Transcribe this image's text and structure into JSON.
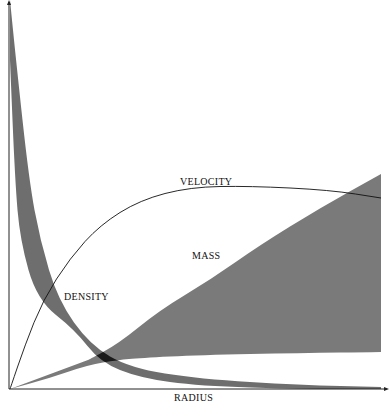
{
  "chart_data": {
    "type": "area",
    "title": "",
    "xlabel": "RADIUS",
    "ylabel": "",
    "grid": false,
    "legend": "none (inline labels)",
    "axis_ranges": {
      "x": [
        0,
        1
      ],
      "y": [
        0,
        1
      ]
    },
    "annotations": [
      "VELOCITY",
      "MASS",
      "DENSITY"
    ],
    "series": [
      {
        "name": "DENSITY",
        "style": "shaded band (dark gray)",
        "color": "#6e6e6e",
        "upper_edge": [
          [
            10,
            0
          ],
          [
            16,
            60
          ],
          [
            29,
            180
          ],
          [
            40,
            240
          ],
          [
            58,
            300
          ],
          [
            90,
            345
          ],
          [
            130,
            368
          ],
          [
            200,
            379
          ],
          [
            300,
            385
          ],
          [
            381,
            387
          ]
        ],
        "lower_edge": [
          [
            381,
            389
          ],
          [
            300,
            389
          ],
          [
            200,
            386
          ],
          [
            140,
            378
          ],
          [
            100,
            362
          ],
          [
            75,
            330
          ],
          [
            37,
            300
          ],
          [
            20,
            240
          ],
          [
            15,
            180
          ],
          [
            10,
            60
          ]
        ]
      },
      {
        "name": "MASS",
        "style": "shaded wedge (gray)",
        "color": "#7a7a7a",
        "upper_edge": [
          [
            88,
            360
          ],
          [
            118,
            344
          ],
          [
            160,
            310
          ],
          [
            210,
            280
          ],
          [
            260,
            245
          ],
          [
            320,
            208
          ],
          [
            381,
            174
          ]
        ],
        "lower_edge": [
          [
            381,
            352
          ],
          [
            300,
            353
          ],
          [
            200,
            355
          ],
          [
            140,
            358
          ],
          [
            118,
            360
          ],
          [
            88,
            365
          ],
          [
            50,
            378
          ],
          [
            10,
            389
          ]
        ]
      },
      {
        "name": "VELOCITY",
        "style": "thin black line",
        "color": "#111111",
        "points": [
          [
            10,
            389
          ],
          [
            25,
            345
          ],
          [
            43,
            300
          ],
          [
            70,
            258
          ],
          [
            100,
            225
          ],
          [
            140,
            200
          ],
          [
            190,
            187
          ],
          [
            250,
            186
          ],
          [
            330,
            190
          ],
          [
            381,
            198
          ]
        ]
      }
    ],
    "overlap_region": {
      "description": "dark intersection of density and mass bands",
      "color": "#1a1a1a"
    }
  },
  "labels": {
    "velocity": "VELOCITY",
    "mass": "MASS",
    "density": "DENSITY",
    "radius": "RADIUS"
  },
  "colors": {
    "density": "#6e6e6e",
    "mass": "#7a7a7a",
    "overlap": "#1a1a1a",
    "axis": "#222222"
  }
}
